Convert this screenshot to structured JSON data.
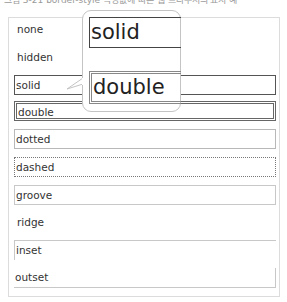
{
  "caption": "그림 3-21 border-style 속성값에 따른 웹 브라우저의 표시 예",
  "rows": [
    {
      "label": "none",
      "style": "none"
    },
    {
      "label": "hidden",
      "style": "hidden"
    },
    {
      "label": "solid",
      "style": "solid"
    },
    {
      "label": "double",
      "style": "double"
    },
    {
      "label": "dotted",
      "style": "dotted"
    },
    {
      "label": "dashed",
      "style": "dashed"
    },
    {
      "label": "groove",
      "style": "groove"
    },
    {
      "label": "ridge",
      "style": "ridge"
    },
    {
      "label": "inset",
      "style": "inset"
    },
    {
      "label": "outset",
      "style": "outset"
    }
  ],
  "callout": {
    "zoom_solid": "solid",
    "zoom_double": "double"
  },
  "colors": {
    "panel_border": "#dcdcdc",
    "text": "#333333",
    "solid_border": "#555555",
    "callout_border": "#c4c4c4"
  }
}
